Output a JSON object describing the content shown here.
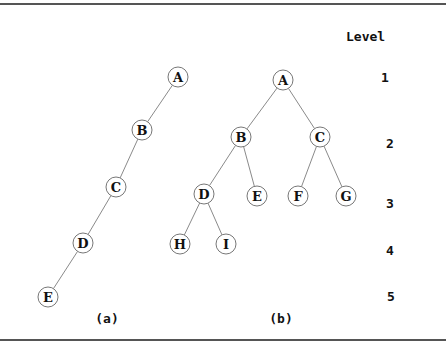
{
  "level_header": "Level",
  "levels": [
    {
      "label": "1",
      "x": 385,
      "y": 77
    },
    {
      "label": "2",
      "x": 390,
      "y": 143
    },
    {
      "label": "3",
      "x": 390,
      "y": 203
    },
    {
      "label": "4",
      "x": 390,
      "y": 250
    },
    {
      "label": "5",
      "x": 391,
      "y": 296
    }
  ],
  "trees": [
    {
      "caption": "(a)",
      "caption_pos": [
        107,
        318
      ],
      "nodes": [
        {
          "id": "A",
          "label": "A",
          "x": 178,
          "y": 77
        },
        {
          "id": "B",
          "label": "B",
          "x": 142,
          "y": 130
        },
        {
          "id": "C",
          "label": "C",
          "x": 116,
          "y": 187
        },
        {
          "id": "D",
          "label": "D",
          "x": 83,
          "y": 243
        },
        {
          "id": "E",
          "label": "E",
          "x": 48,
          "y": 297
        }
      ],
      "edges": [
        [
          "A",
          "B"
        ],
        [
          "B",
          "C"
        ],
        [
          "C",
          "D"
        ],
        [
          "D",
          "E"
        ]
      ]
    },
    {
      "caption": "(b)",
      "caption_pos": [
        281,
        318
      ],
      "nodes": [
        {
          "id": "A",
          "label": "A",
          "x": 283,
          "y": 80
        },
        {
          "id": "B",
          "label": "B",
          "x": 241,
          "y": 137
        },
        {
          "id": "C",
          "label": "C",
          "x": 320,
          "y": 137
        },
        {
          "id": "D",
          "label": "D",
          "x": 204,
          "y": 194
        },
        {
          "id": "E",
          "label": "E",
          "x": 257,
          "y": 196
        },
        {
          "id": "F",
          "label": "F",
          "x": 298,
          "y": 196
        },
        {
          "id": "G",
          "label": "G",
          "x": 346,
          "y": 196
        },
        {
          "id": "H",
          "label": "H",
          "x": 180,
          "y": 244
        },
        {
          "id": "I",
          "label": "I",
          "x": 226,
          "y": 244
        }
      ],
      "edges": [
        [
          "A",
          "B"
        ],
        [
          "A",
          "C"
        ],
        [
          "B",
          "D"
        ],
        [
          "B",
          "E"
        ],
        [
          "C",
          "F"
        ],
        [
          "C",
          "G"
        ],
        [
          "D",
          "H"
        ],
        [
          "D",
          "I"
        ]
      ]
    }
  ],
  "node_radius": 10,
  "colors": {
    "edge": "#8a8a8a",
    "node_stroke": "#777777",
    "text": "#111111",
    "rule": "#555555"
  }
}
